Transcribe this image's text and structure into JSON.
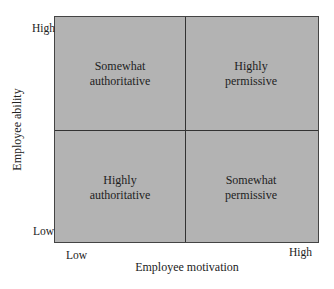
{
  "diagram": {
    "quadrants": {
      "top_left": [
        "Somewhat",
        "authoritative"
      ],
      "top_right": [
        "Highly",
        "permissive"
      ],
      "bottom_left": [
        "Highly",
        "authoritative"
      ],
      "bottom_right": [
        "Somewhat",
        "permissive"
      ]
    },
    "y_axis": {
      "label": "Employee ability",
      "high": "High",
      "low": "Low"
    },
    "x_axis": {
      "label": "Employee motivation",
      "low": "Low",
      "high": "High"
    }
  }
}
